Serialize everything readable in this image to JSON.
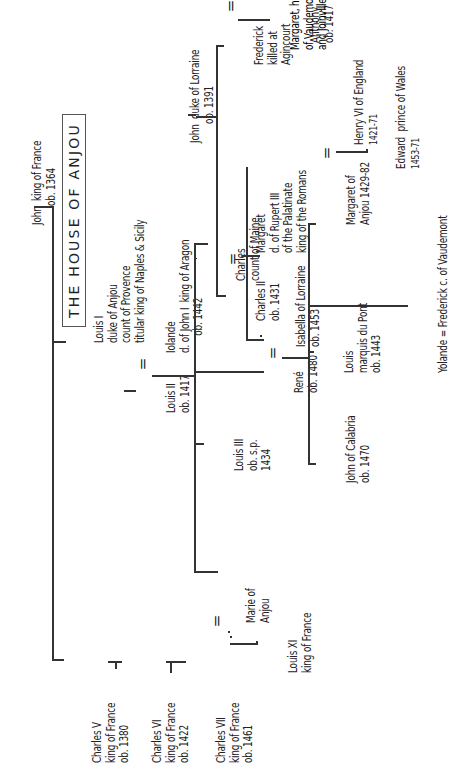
{
  "title": "THE HOUSE OF ANJOU",
  "people": {
    "john_france": [
      "John  king of France",
      "ob. 1364"
    ],
    "charles_v": [
      "Charles V",
      "king of France",
      "ob. 1380"
    ],
    "charles_vi": [
      "Charles VI",
      "king of France",
      "ob. 1422"
    ],
    "charles_vii": [
      "Charles VII",
      "king of France",
      "ob. 1461"
    ],
    "marie": [
      "Marie of",
      "Anjou"
    ],
    "louis_xi": [
      "Louis XI",
      "king of France"
    ],
    "louis_i": [
      "Louis I",
      "duke of Anjou",
      "count of Provence",
      "titular king of Naples & Sicily"
    ],
    "louis_ii": [
      "Louis II",
      "ob. 1417"
    ],
    "iolande": [
      "Iolande",
      "d. of John I  king of Aragon",
      "ob. 1442"
    ],
    "louis_iii": [
      "Louis III",
      "ob. s.p.",
      "1434"
    ],
    "charles_maine": [
      "Charles",
      "count of Maine"
    ],
    "rene": [
      "René",
      "ob. 1480"
    ],
    "isabella": [
      "Isabella of Lorraine",
      "ob. 1453"
    ],
    "john_calabria": [
      "John of Calabria",
      "ob. 1470"
    ],
    "louis_pont": [
      "Louis",
      "marquis du Pont",
      "ob. 1443"
    ],
    "margaret_anjou": [
      "Margaret of",
      "Anjou 1429-82"
    ],
    "henry_vi": [
      "Henry VI of England",
      "1421-71"
    ],
    "edward": [
      "Edward  prince of Wales",
      "1453-71"
    ],
    "yolande": [
      "Yolande = Frederick c. of Vaudemont"
    ],
    "john_lorraine": [
      "John  duke of Lorraine",
      "ob. 1391"
    ],
    "charles_ii": [
      "Charles II",
      "ob. 1431"
    ],
    "margaret_rupert": [
      "Margaret",
      "d. of Rupert III",
      "of the Palatinate",
      "king of the Romans"
    ],
    "frederick": [
      "Frederick",
      "killed at",
      "Agincourt"
    ],
    "margaret_vaudemont": [
      "Margaret, heiress",
      "of Vaudemont",
      "and Joinville"
    ],
    "anthony": [
      "Anthony",
      "ob. 1417"
    ]
  },
  "marriage_symbol": "="
}
